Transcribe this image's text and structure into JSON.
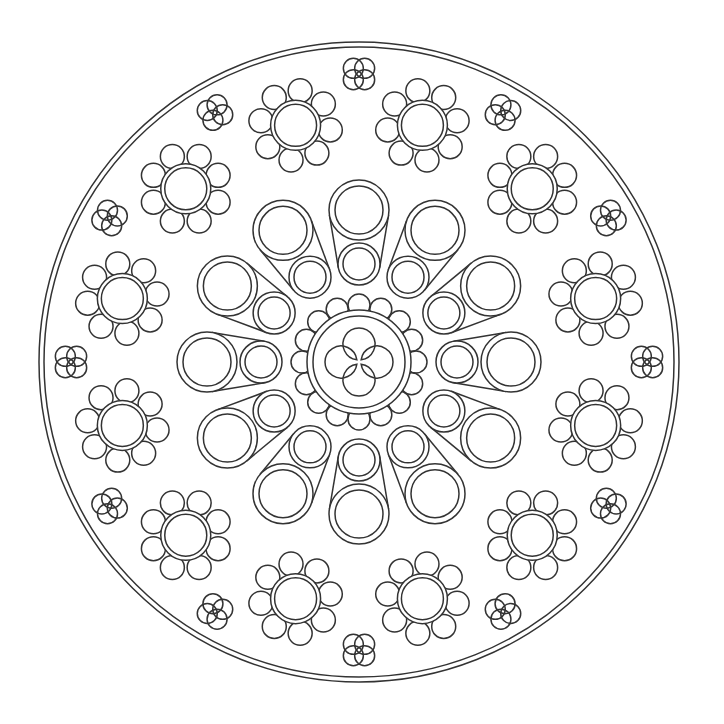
{
  "image": {
    "subject": "rose-window mandala line art",
    "width": 724,
    "height": 724,
    "background": "#ffffff",
    "stroke": "#333333"
  },
  "geometry": {
    "center": [
      359,
      362
    ],
    "outer_ring": {
      "r_outer": 320,
      "r_inner": 315
    },
    "central_rosette": {
      "ring_outer": 52,
      "ring_inner": 46,
      "petal_count": 16,
      "petal_r": 11,
      "petal_dist": 57,
      "quatrefoil_lobe_r": 16,
      "quatrefoil_lobe_dist": 18
    },
    "tubes": {
      "count": 12,
      "start_deg": 0,
      "large_dist": 152,
      "large_r_outer": 30,
      "large_r_inner": 24,
      "small_dist": 98,
      "small_r_outer": 21,
      "small_r_inner": 16
    },
    "flowers": {
      "count": 12,
      "start_deg": 15,
      "dist": 245,
      "ring_outer": 25,
      "ring_inner": 21,
      "petal_count": 8,
      "petal_r": 12,
      "petal_dist": 35
    },
    "clovers": {
      "count": 12,
      "start_deg": 0,
      "dist": 288,
      "lobe_r": 10,
      "lobe_dist": 8
    }
  }
}
